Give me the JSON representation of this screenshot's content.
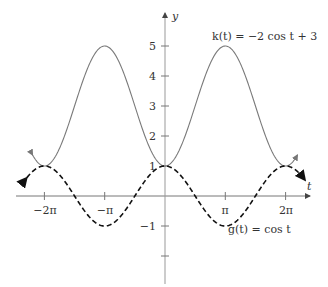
{
  "chart_data": {
    "type": "line",
    "title": "",
    "xlabel": "t",
    "ylabel": "y",
    "xlim_units": "radians",
    "xlim": [
      -7.0,
      7.5
    ],
    "ylim": [
      -2.5,
      5.7
    ],
    "grid": false,
    "x_ticks": [
      {
        "value": -6.2832,
        "label": "−2π"
      },
      {
        "value": -3.1416,
        "label": "−π"
      },
      {
        "value": 3.1416,
        "label": "π"
      },
      {
        "value": 6.2832,
        "label": "2π"
      }
    ],
    "y_ticks": [
      {
        "value": 5,
        "label": "5"
      },
      {
        "value": 4,
        "label": "4"
      },
      {
        "value": 3,
        "label": "3"
      },
      {
        "value": 2,
        "label": "2"
      },
      {
        "value": 1,
        "label": "1"
      },
      {
        "value": -1,
        "label": "−1"
      },
      {
        "value": -2,
        "label": ""
      }
    ],
    "series": [
      {
        "name": "k(t) = −2 cos t + 3",
        "style": "solid",
        "color": "#777777",
        "formula": "-2*cos(t)+3",
        "domain": [
          -6.9,
          6.9
        ],
        "key_points": [
          [
            -6.2832,
            1
          ],
          [
            -3.1416,
            5
          ],
          [
            0,
            1
          ],
          [
            3.1416,
            5
          ],
          [
            6.2832,
            1
          ]
        ]
      },
      {
        "name": "g(t) = cos t",
        "style": "dashed",
        "color": "#111111",
        "formula": "cos(t)",
        "domain": [
          -7.2,
          7.3
        ],
        "key_points": [
          [
            -6.2832,
            1
          ],
          [
            -3.1416,
            -1
          ],
          [
            0,
            1
          ],
          [
            3.1416,
            -1
          ],
          [
            6.2832,
            1
          ]
        ]
      }
    ],
    "annotations": [
      {
        "text": "k(t) = −2 cos t + 3",
        "near": "top-right"
      },
      {
        "text": "g(t) = cos t",
        "near": "bottom-right"
      }
    ]
  },
  "labels": {
    "x_axis": "t",
    "y_axis": "y",
    "k_label": "k(t) = −2 cos t + 3",
    "g_label": "g(t) = cos t",
    "tick_neg2pi": "−2π",
    "tick_negpi": "−π",
    "tick_pi": "π",
    "tick_2pi": "2π",
    "tick_5": "5",
    "tick_4": "4",
    "tick_3": "3",
    "tick_2": "2",
    "tick_1": "1",
    "tick_neg1": "−1"
  }
}
